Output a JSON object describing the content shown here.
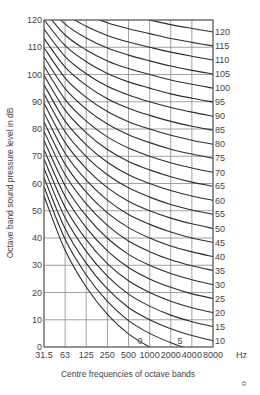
{
  "chart_data": {
    "type": "line",
    "title": "",
    "xlabel": "Centre frequencies of octave bands",
    "ylabel": "Octave band sound pressure level in dB",
    "x_unit": "Hz",
    "categories": [
      "31.5",
      "63",
      "125",
      "250",
      "500",
      "1000",
      "2000",
      "4000",
      "8000"
    ],
    "ylim": [
      0,
      120
    ],
    "yticks": [
      0,
      10,
      20,
      30,
      40,
      50,
      60,
      70,
      80,
      90,
      100,
      110,
      120
    ],
    "grid": true,
    "legend": "curve labels at right end (NR index)",
    "curve_labels_right": [
      "120",
      "115",
      "110",
      "105",
      "100",
      "95",
      "90",
      "85",
      "80",
      "75",
      "70",
      "65",
      "60",
      "55",
      "50",
      "45",
      "40",
      "35",
      "30",
      "25",
      "20",
      "15",
      "10"
    ],
    "curve_labels_inside": [
      "0",
      "5"
    ],
    "nr_coefficients": {
      "a": [
        55.4,
        35.5,
        22.0,
        12.0,
        4.8,
        0.0,
        -3.5,
        -6.1,
        -8.0
      ],
      "b": [
        0.681,
        0.79,
        0.87,
        0.93,
        0.974,
        1.0,
        1.015,
        1.025,
        1.03
      ]
    },
    "series": [
      {
        "name": "0",
        "values": [
          55.4,
          35.5,
          22.0,
          12.0,
          4.8,
          0.0,
          -3.5,
          -6.1,
          -8.0
        ]
      },
      {
        "name": "5",
        "values": [
          58.8,
          39.5,
          26.4,
          16.7,
          9.7,
          5.0,
          1.6,
          -1.0,
          -2.9
        ]
      },
      {
        "name": "10",
        "values": [
          62.2,
          43.4,
          30.7,
          21.3,
          14.5,
          10.0,
          6.7,
          4.2,
          2.3
        ]
      },
      {
        "name": "15",
        "values": [
          65.6,
          47.4,
          35.1,
          26.0,
          19.4,
          15.0,
          11.7,
          9.3,
          7.5
        ]
      },
      {
        "name": "20",
        "values": [
          69.0,
          51.3,
          39.4,
          30.6,
          24.3,
          20.0,
          16.8,
          14.4,
          12.6
        ]
      },
      {
        "name": "25",
        "values": [
          72.4,
          55.3,
          43.8,
          35.3,
          29.2,
          25.0,
          21.9,
          19.5,
          17.8
        ]
      },
      {
        "name": "30",
        "values": [
          75.8,
          59.2,
          48.1,
          39.9,
          34.0,
          30.0,
          27.0,
          24.7,
          22.9
        ]
      },
      {
        "name": "35",
        "values": [
          79.2,
          63.2,
          52.5,
          44.6,
          38.9,
          35.0,
          32.0,
          29.8,
          28.1
        ]
      },
      {
        "name": "40",
        "values": [
          82.6,
          67.1,
          56.8,
          49.2,
          43.8,
          40.0,
          37.1,
          34.9,
          33.2
        ]
      },
      {
        "name": "45",
        "values": [
          86.0,
          71.1,
          61.2,
          53.9,
          48.6,
          45.0,
          42.2,
          40.0,
          38.4
        ]
      },
      {
        "name": "50",
        "values": [
          89.5,
          75.0,
          65.5,
          58.5,
          53.5,
          50.0,
          47.3,
          45.2,
          43.5
        ]
      },
      {
        "name": "55",
        "values": [
          92.9,
          79.0,
          69.9,
          63.2,
          58.4,
          55.0,
          52.3,
          50.3,
          48.7
        ]
      },
      {
        "name": "60",
        "values": [
          96.3,
          82.9,
          74.2,
          67.8,
          63.2,
          60.0,
          57.4,
          55.4,
          53.8
        ]
      },
      {
        "name": "65",
        "values": [
          99.7,
          86.9,
          78.6,
          72.5,
          68.1,
          65.0,
          62.5,
          60.5,
          59.0
        ]
      },
      {
        "name": "70",
        "values": [
          103.1,
          90.8,
          82.9,
          77.1,
          73.0,
          70.0,
          67.6,
          65.7,
          64.1
        ]
      },
      {
        "name": "75",
        "values": [
          106.5,
          94.8,
          87.3,
          81.8,
          77.9,
          75.0,
          72.6,
          70.8,
          69.3
        ]
      },
      {
        "name": "80",
        "values": [
          109.9,
          98.7,
          91.6,
          86.4,
          82.7,
          80.0,
          77.7,
          75.9,
          74.4
        ]
      },
      {
        "name": "85",
        "values": [
          113.3,
          102.7,
          96.0,
          91.1,
          87.6,
          85.0,
          82.8,
          81.0,
          79.6
        ]
      },
      {
        "name": "90",
        "values": [
          116.7,
          106.6,
          100.3,
          95.7,
          92.5,
          90.0,
          87.9,
          86.2,
          84.7
        ]
      },
      {
        "name": "95",
        "values": [
          120.1,
          110.6,
          104.7,
          100.4,
          97.3,
          95.0,
          92.9,
          91.3,
          89.9
        ]
      },
      {
        "name": "100",
        "values": [
          123.5,
          114.5,
          109.0,
          105.0,
          102.2,
          100.0,
          98.0,
          96.4,
          95.0
        ]
      },
      {
        "name": "105",
        "values": [
          126.9,
          118.5,
          113.4,
          109.7,
          107.1,
          105.0,
          103.1,
          101.5,
          100.2
        ]
      },
      {
        "name": "110",
        "values": [
          130.3,
          122.4,
          117.7,
          114.3,
          111.9,
          110.0,
          108.2,
          106.7,
          105.3
        ]
      },
      {
        "name": "115",
        "values": [
          133.7,
          126.4,
          122.1,
          119.0,
          116.8,
          115.0,
          113.2,
          111.8,
          110.5
        ]
      },
      {
        "name": "120",
        "values": [
          137.1,
          130.3,
          126.4,
          123.6,
          121.7,
          120.0,
          118.3,
          116.9,
          115.6
        ]
      }
    ]
  },
  "axes": {
    "xlabel": "Centre frequencies of octave bands",
    "ylabel": "Octave band sound pressure level in dB",
    "x_unit": "Hz"
  },
  "corner_mark": "ℴ"
}
